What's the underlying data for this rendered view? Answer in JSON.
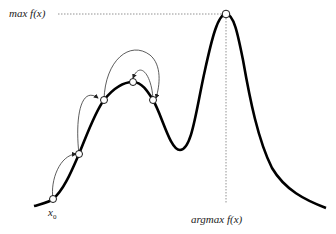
{
  "labels": {
    "max": "max f(x)",
    "argmax": "argmax f(x)",
    "start": "x",
    "start_sub": "0"
  },
  "colors": {
    "curve": "#000000",
    "arrows": "#333333",
    "guides": "#666666",
    "points_fill": "#ffffff"
  },
  "points": [
    {
      "name": "x0",
      "x": 53,
      "y": 199
    },
    {
      "name": "p1",
      "x": 79,
      "y": 154
    },
    {
      "name": "p2",
      "x": 104,
      "y": 100
    },
    {
      "name": "p3",
      "x": 133,
      "y": 82
    },
    {
      "name": "p4",
      "x": 153,
      "y": 100
    },
    {
      "name": "max",
      "x": 226,
      "y": 14
    }
  ]
}
